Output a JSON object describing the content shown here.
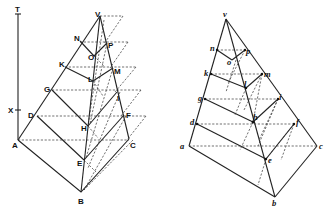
{
  "figure_left": {
    "description": "Perspective construction of a pyramid with horizontal section planes (uppercase labels)",
    "labels": {
      "T": "T",
      "X": "X",
      "A": "A",
      "V": "V",
      "N": "N",
      "P": "P",
      "O": "O",
      "K": "K",
      "M": "M",
      "L": "L",
      "G": "G",
      "I": "I",
      "D": "D",
      "F": "F",
      "H": "H",
      "E": "E",
      "C": "C",
      "B": "B"
    }
  },
  "figure_right": {
    "description": "Corresponding construction with lowercase labels",
    "labels": {
      "v": "v",
      "n": "n",
      "p": "p",
      "o": "o",
      "k": "k",
      "m": "m",
      "l": "l",
      "g": "g",
      "i": "i",
      "h": "h",
      "d": "d",
      "f": "f",
      "a": "a",
      "c": "c",
      "e": "e",
      "b": "b"
    }
  }
}
